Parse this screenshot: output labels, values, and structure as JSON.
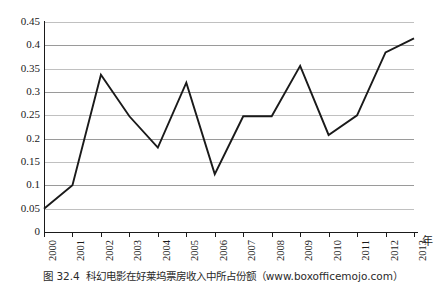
{
  "chart_data": {
    "type": "line",
    "title": "",
    "subtitle": "",
    "xlabel": "年",
    "ylabel": "",
    "categories": [
      "2000",
      "2001",
      "2002",
      "2003",
      "2004",
      "2005",
      "2006",
      "2007",
      "2008",
      "2009",
      "2010",
      "2011",
      "2012",
      "2013"
    ],
    "values": [
      0.05,
      0.1,
      0.337,
      0.248,
      0.181,
      0.32,
      0.124,
      0.248,
      0.248,
      0.356,
      0.208,
      0.25,
      0.385,
      0.415
    ],
    "series": [
      {
        "name": "科幻电影票房份额",
        "values": [
          0.05,
          0.1,
          0.337,
          0.248,
          0.181,
          0.32,
          0.124,
          0.248,
          0.248,
          0.356,
          0.208,
          0.25,
          0.385,
          0.415
        ]
      }
    ],
    "ylim": [
      0,
      0.45
    ],
    "yticks": [
      0,
      0.05,
      0.1,
      0.15,
      0.2,
      0.25,
      0.3,
      0.35,
      0.4,
      0.45
    ],
    "ytick_labels": [
      "0",
      "0.05",
      "0.1",
      "0.15",
      "0.2",
      "0.25",
      "0.3",
      "0.35",
      "0.4",
      "0.45"
    ],
    "xtick_labels": [
      "2000",
      "2001",
      "2002",
      "2003",
      "2004",
      "2005",
      "2006",
      "2007",
      "2008",
      "2009",
      "2010",
      "2011",
      "2012",
      "2013"
    ],
    "grid": true,
    "grid_axis": "y",
    "legend": false,
    "legend_position": "none",
    "line_color": "#1a1a1a",
    "grid_color": "#9a9a9a",
    "markers": false,
    "annotations": []
  },
  "caption": {
    "number": "图 32.4",
    "text": "科幻电影在好莱坞票房收入中所占份额（www.boxofficemojo.com）",
    "full": "图 32.4  科幻电影在好莱坞票房收入中所占份额（www.boxofficemojo.com）"
  },
  "axis": {
    "x_unit_label": "年"
  }
}
